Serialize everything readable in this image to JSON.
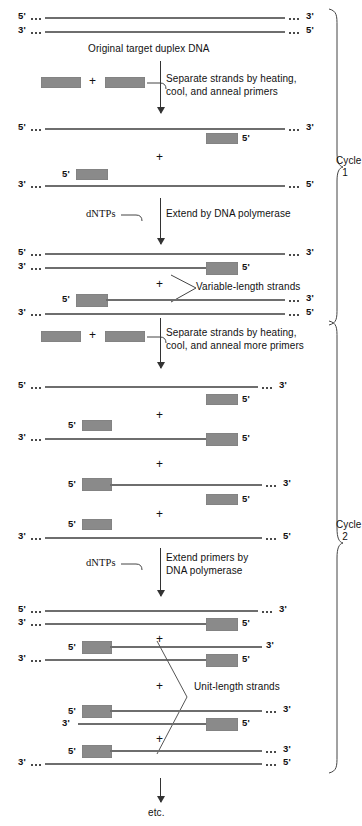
{
  "figure": {
    "title_caption": "Original target duplex DNA",
    "end_labels": {
      "five": "5'",
      "three": "3'"
    },
    "plus": "+",
    "footer": "etc."
  },
  "steps": {
    "step1_line1": "Separate strands by heating,",
    "step1_line2": "cool, and anneal primers",
    "step2_label": "dNTPs",
    "step2_text": "Extend by DNA polymerase",
    "step3_line1": "Separate strands by heating,",
    "step3_line2": "cool, and anneal more primers",
    "step4_label": "dNTPs",
    "step4_line1": "Extend primers by",
    "step4_line2": "DNA polymerase"
  },
  "annotations": {
    "variable_length": "Variable-length strands",
    "unit_length": "Unit-length strands"
  },
  "cycles": [
    {
      "name": "Cycle",
      "number": "1"
    },
    {
      "name": "Cycle",
      "number": "2"
    }
  ],
  "colors": {
    "primer_fill": "#8a8a8a",
    "strand": "#6e6e6e",
    "text": "#111111",
    "arrow": "#333333",
    "background": "#ffffff"
  },
  "strand_rows": [
    {
      "id": "orig-top",
      "left_label": "5'",
      "right_label": "3'"
    },
    {
      "id": "orig-bottom",
      "left_label": "3'",
      "right_label": "5'"
    },
    {
      "id": "c1-a",
      "left_label": "5'",
      "right_label": "3'",
      "primer_label": "5'"
    },
    {
      "id": "c1-b",
      "left_label": "3'",
      "right_label": "5'",
      "primer_label": "5'"
    },
    {
      "id": "c1-ext-a1",
      "left_label": "5'",
      "right_label": "3'"
    },
    {
      "id": "c1-ext-a2",
      "left_label": "3'",
      "right_label": "",
      "primer_label": "5'"
    },
    {
      "id": "c1-ext-b1",
      "left_label": "",
      "right_label": "3'",
      "primer_label": "5'"
    },
    {
      "id": "c1-ext-b2",
      "left_label": "3'",
      "right_label": "5'"
    },
    {
      "id": "c2-a1",
      "left_label": "5'",
      "right_label": "3'"
    },
    {
      "id": "c2-a2",
      "left_label": "",
      "right_label": "",
      "primer_label": "5'"
    },
    {
      "id": "c2-b1",
      "left_label": "",
      "right_label": "",
      "primer_label": "5'"
    },
    {
      "id": "c2-b2",
      "left_label": "3'",
      "right_label": "",
      "primer_label": "5'"
    },
    {
      "id": "c2-c1",
      "left_label": "",
      "right_label": "3'",
      "primer_label": "5'"
    },
    {
      "id": "c2-c2",
      "left_label": "",
      "right_label": "",
      "primer_label": "5'"
    },
    {
      "id": "c2-d",
      "left_label": "3'",
      "right_label": "5'"
    },
    {
      "id": "c2-ext-a1",
      "left_label": "5'",
      "right_label": "3'"
    },
    {
      "id": "c2-ext-a2",
      "left_label": "3'",
      "right_label": "",
      "primer_label": "5'"
    },
    {
      "id": "c2-ext-b1",
      "left_label": "",
      "right_label": "3'",
      "primer_label": "5'"
    },
    {
      "id": "c2-ext-b2",
      "left_label": "3'",
      "right_label": "",
      "primer_label": "5'"
    },
    {
      "id": "c2-ext-c1",
      "left_label": "",
      "right_label": "3'",
      "primer_label": "5'"
    },
    {
      "id": "c2-ext-c2",
      "left_label": "3'",
      "right_label": "",
      "primer_label": "5'"
    },
    {
      "id": "c2-ext-d1",
      "left_label": "",
      "right_label": "3'",
      "primer_label": "5'"
    },
    {
      "id": "c2-ext-d2",
      "left_label": "3'",
      "right_label": "5'"
    }
  ]
}
